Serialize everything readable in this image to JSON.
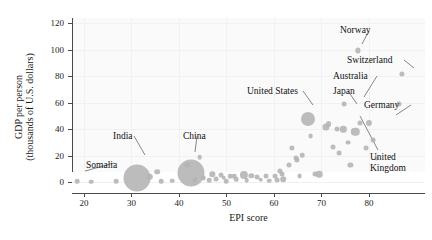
{
  "chart_data": {
    "type": "scatter",
    "title": "",
    "xlabel": "EPI score",
    "ylabel": "GDP per person (thousands of U.S. dollars)",
    "ylabel_line1": "GDP per person",
    "ylabel_line2": "(thousands of U.S. dollars)",
    "xlim": [
      17.5,
      91.8
    ],
    "ylim": [
      -8,
      124
    ],
    "xticks": [
      20,
      30,
      40,
      50,
      60,
      70,
      80
    ],
    "yticks": [
      0,
      20,
      40,
      60,
      80,
      100,
      120
    ],
    "grid": true,
    "legend": "none",
    "size_encoding": "population",
    "marker_color": "#b3b3b3",
    "points": [
      {
        "x": 18.6,
        "y": 0.8,
        "r": 2.3,
        "label": "Somalia"
      },
      {
        "x": 21.6,
        "y": 0.6,
        "r": 2.3,
        "label": ""
      },
      {
        "x": 26.8,
        "y": 0.9,
        "r": 2.3,
        "label": ""
      },
      {
        "x": 31.2,
        "y": 3.2,
        "r": 13.5,
        "label": "India"
      },
      {
        "x": 33.9,
        "y": 4.0,
        "r": 3.2,
        "label": ""
      },
      {
        "x": 35.4,
        "y": 8.0,
        "r": 2.8,
        "label": ""
      },
      {
        "x": 36.3,
        "y": 1.0,
        "r": 2.3,
        "label": ""
      },
      {
        "x": 38.6,
        "y": 1.2,
        "r": 2.3,
        "label": ""
      },
      {
        "x": 42.6,
        "y": 7.0,
        "r": 13.5,
        "label": "China"
      },
      {
        "x": 41.8,
        "y": 13.0,
        "r": 2.6,
        "label": ""
      },
      {
        "x": 43.4,
        "y": 2.0,
        "r": 2.6,
        "label": ""
      },
      {
        "x": 44.4,
        "y": 19.0,
        "r": 2.3,
        "label": ""
      },
      {
        "x": 45.2,
        "y": 3.5,
        "r": 2.4,
        "label": ""
      },
      {
        "x": 46.4,
        "y": 1.8,
        "r": 2.3,
        "label": ""
      },
      {
        "x": 47.0,
        "y": 6.0,
        "r": 2.7,
        "label": ""
      },
      {
        "x": 47.8,
        "y": 2.6,
        "r": 2.4,
        "label": ""
      },
      {
        "x": 48.8,
        "y": 5.5,
        "r": 2.5,
        "label": ""
      },
      {
        "x": 49.4,
        "y": 3.4,
        "r": 2.3,
        "label": ""
      },
      {
        "x": 50.0,
        "y": 1.0,
        "r": 2.3,
        "label": ""
      },
      {
        "x": 50.8,
        "y": 4.5,
        "r": 2.3,
        "label": ""
      },
      {
        "x": 51.6,
        "y": 4.6,
        "r": 2.3,
        "label": ""
      },
      {
        "x": 52.1,
        "y": 2.2,
        "r": 2.3,
        "label": ""
      },
      {
        "x": 53.6,
        "y": 5.5,
        "r": 4.1,
        "label": ""
      },
      {
        "x": 54.3,
        "y": 1.5,
        "r": 2.3,
        "label": ""
      },
      {
        "x": 55.2,
        "y": 5.0,
        "r": 2.7,
        "label": ""
      },
      {
        "x": 56.4,
        "y": 4.0,
        "r": 2.4,
        "label": ""
      },
      {
        "x": 57.2,
        "y": 2.0,
        "r": 2.3,
        "label": ""
      },
      {
        "x": 58.4,
        "y": 4.9,
        "r": 2.5,
        "label": ""
      },
      {
        "x": 59.0,
        "y": 1.3,
        "r": 2.3,
        "label": ""
      },
      {
        "x": 60.2,
        "y": 5.1,
        "r": 2.5,
        "label": ""
      },
      {
        "x": 60.6,
        "y": 1.9,
        "r": 2.4,
        "label": ""
      },
      {
        "x": 61.3,
        "y": 8.4,
        "r": 2.6,
        "label": ""
      },
      {
        "x": 61.6,
        "y": 6.0,
        "r": 2.5,
        "label": ""
      },
      {
        "x": 62.0,
        "y": 2.4,
        "r": 2.8,
        "label": ""
      },
      {
        "x": 63.2,
        "y": 12.8,
        "r": 2.5,
        "label": ""
      },
      {
        "x": 63.8,
        "y": 26.0,
        "r": 2.6,
        "label": ""
      },
      {
        "x": 64.6,
        "y": 18.5,
        "r": 2.5,
        "label": ""
      },
      {
        "x": 64.9,
        "y": 17.0,
        "r": 2.6,
        "label": ""
      },
      {
        "x": 65.4,
        "y": 4.5,
        "r": 2.4,
        "label": ""
      },
      {
        "x": 66.0,
        "y": 20.5,
        "r": 2.3,
        "label": ""
      },
      {
        "x": 67.2,
        "y": 48.0,
        "r": 7.0,
        "label": "United States"
      },
      {
        "x": 67.7,
        "y": 35.0,
        "r": 2.4,
        "label": ""
      },
      {
        "x": 68.6,
        "y": 6.0,
        "r": 2.5,
        "label": ""
      },
      {
        "x": 69.5,
        "y": 6.4,
        "r": 3.3,
        "label": ""
      },
      {
        "x": 70.9,
        "y": 42.0,
        "r": 3.6,
        "label": "Japan"
      },
      {
        "x": 71.5,
        "y": 44.0,
        "r": 2.9,
        "label": ""
      },
      {
        "x": 72.4,
        "y": 27.0,
        "r": 2.5,
        "label": ""
      },
      {
        "x": 73.2,
        "y": 40.5,
        "r": 2.5,
        "label": ""
      },
      {
        "x": 73.8,
        "y": 22.0,
        "r": 2.4,
        "label": ""
      },
      {
        "x": 74.6,
        "y": 40.0,
        "r": 3.2,
        "label": ""
      },
      {
        "x": 74.8,
        "y": 59.0,
        "r": 2.4,
        "label": ""
      },
      {
        "x": 75.6,
        "y": 30.0,
        "r": 2.4,
        "label": ""
      },
      {
        "x": 76.1,
        "y": 13.0,
        "r": 2.6,
        "label": ""
      },
      {
        "x": 77.1,
        "y": 38.0,
        "r": 4.2,
        "label": "United Kingdom"
      },
      {
        "x": 77.6,
        "y": 99.5,
        "r": 2.6,
        "label": "Norway"
      },
      {
        "x": 78.2,
        "y": 44.5,
        "r": 2.5,
        "label": "Australia"
      },
      {
        "x": 79.4,
        "y": 26.0,
        "r": 2.5,
        "label": ""
      },
      {
        "x": 80.0,
        "y": 45.0,
        "r": 3.1,
        "label": "Germany"
      },
      {
        "x": 80.8,
        "y": 32.0,
        "r": 2.4,
        "label": ""
      },
      {
        "x": 81.6,
        "y": 18.0,
        "r": 2.4,
        "label": ""
      },
      {
        "x": 86.4,
        "y": 59.5,
        "r": 2.5,
        "label": ""
      },
      {
        "x": 87.0,
        "y": 82.0,
        "r": 2.6,
        "label": "Switzerland"
      }
    ],
    "annotations": [
      {
        "name": "somalia",
        "text": "Somalia",
        "x": 86,
        "y": 160,
        "leader": {
          "x1": 114,
          "y1": 163,
          "x2": 85,
          "y2": 171
        }
      },
      {
        "name": "india",
        "text": "India",
        "x": 113,
        "y": 131,
        "leader": {
          "x1": 134,
          "y1": 136,
          "x2": 145,
          "y2": 155
        }
      },
      {
        "name": "china",
        "text": "China",
        "x": 183,
        "y": 131,
        "leader": {
          "x1": 197,
          "y1": 136,
          "x2": 195,
          "y2": 152
        }
      },
      {
        "name": "united-states",
        "text": "United States",
        "x": 247,
        "y": 86,
        "leader": {
          "x1": 303,
          "y1": 91,
          "x2": 313,
          "y2": 105
        }
      },
      {
        "name": "japan",
        "text": "Japan",
        "x": 333,
        "y": 86,
        "leader": {
          "x1": 348,
          "y1": 91,
          "x2": 357,
          "y2": 104
        }
      },
      {
        "name": "australia",
        "text": "Australia",
        "x": 333,
        "y": 71,
        "leader": {
          "x1": 377,
          "y1": 76,
          "x2": 364,
          "y2": 97
        }
      },
      {
        "name": "germany",
        "text": "Germany",
        "x": 364,
        "y": 100,
        "leader": {
          "x1": 411,
          "y1": 105,
          "x2": 396,
          "y2": 115
        }
      },
      {
        "name": "norway",
        "text": "Norway",
        "x": 340,
        "y": 25,
        "leader": {
          "x1": 369,
          "y1": 31,
          "x2": 362,
          "y2": 44
        }
      },
      {
        "name": "switzerland",
        "text": "Switzerland",
        "x": 347,
        "y": 55,
        "leader": {
          "x1": 404,
          "y1": 60,
          "x2": 414,
          "y2": 68
        }
      },
      {
        "name": "united-kingdom",
        "text": "United",
        "text2": "Kingdom",
        "x": 370,
        "y": 152,
        "leader": {
          "x1": 378,
          "y1": 150,
          "x2": 360,
          "y2": 116
        }
      }
    ]
  }
}
